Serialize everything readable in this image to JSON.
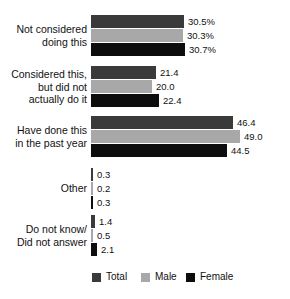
{
  "chart_data": {
    "type": "bar",
    "orientation": "horizontal",
    "title": "",
    "xlabel": "",
    "ylabel": "",
    "grid": false,
    "legend_position": "bottom",
    "xlim": [
      0,
      52
    ],
    "categories": [
      "Not considered\ndoing this",
      "Considered this,\nbut did not\nactually do it",
      "Have done this\nin the past year",
      "Other",
      "Do not know/\nDid not answer"
    ],
    "series": [
      {
        "name": "Total",
        "color": "#3a3a3a",
        "values": [
          30.5,
          21.4,
          46.4,
          0.3,
          1.4
        ]
      },
      {
        "name": "Male",
        "color": "#a8a8a8",
        "values": [
          30.3,
          20.0,
          49.0,
          0.2,
          0.5
        ]
      },
      {
        "name": "Female",
        "color": "#0d0d0d",
        "values": [
          30.7,
          22.4,
          44.5,
          0.3,
          2.1
        ]
      }
    ],
    "data_labels": [
      [
        "30.5%",
        "30.3%",
        "30.7%"
      ],
      [
        "21.4",
        "20.0",
        "22.4"
      ],
      [
        "46.4",
        "49.0",
        "44.5"
      ],
      [
        "0.3",
        "0.2",
        "0.3"
      ],
      [
        "1.4",
        "0.5",
        "2.1"
      ]
    ]
  },
  "legend": {
    "items": [
      {
        "label": "Total",
        "color": "#3a3a3a"
      },
      {
        "label": "Male",
        "color": "#a8a8a8"
      },
      {
        "label": "Female",
        "color": "#0d0d0d"
      }
    ]
  },
  "layout": {
    "bar_origin_x": 91,
    "px_per_unit": 3.05,
    "bar_height": 13,
    "bar_gap": 1,
    "group_tops": [
      15,
      66,
      116,
      168,
      215
    ],
    "legend_x": [
      92,
      141,
      186
    ]
  }
}
